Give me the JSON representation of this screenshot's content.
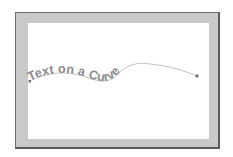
{
  "illustration": {
    "curve_text": "Text on a Curve",
    "colors": {
      "frame": "#c9c9c9",
      "frame_border": "#5a5a5a",
      "canvas": "#ffffff",
      "text": "#8c8c8c",
      "path_line": "#a0a0a0",
      "endpoint": "#777777"
    }
  }
}
